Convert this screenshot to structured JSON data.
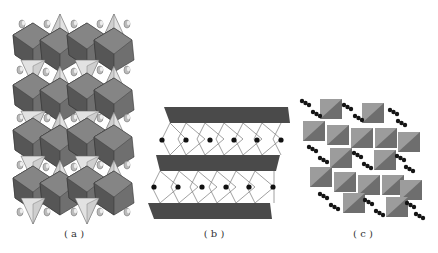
{
  "figure": {
    "panels": [
      {
        "id": "a",
        "label": "( a )",
        "description": "Layered octahedral-tetrahedral framework with cations between layers"
      },
      {
        "id": "b",
        "label": "( b )",
        "description": "Dark sheets separated by corner-sharing rhombic units with black atoms"
      },
      {
        "id": "c",
        "label": "( c )",
        "description": "Tilted polyhedral framework with chains of black atoms in channels"
      }
    ]
  },
  "colors": {
    "octa_dark": "#555555",
    "octa_mid": "#6f6f6f",
    "octa_light": "#8a8a8a",
    "tetra_light": "#d9d9d9",
    "sheet": "#4a4a4a",
    "atom": "#1a1a1a",
    "c_poly_light": "#9a9a9a",
    "c_poly_dark": "#6a6a6a",
    "background": "#ffffff"
  }
}
